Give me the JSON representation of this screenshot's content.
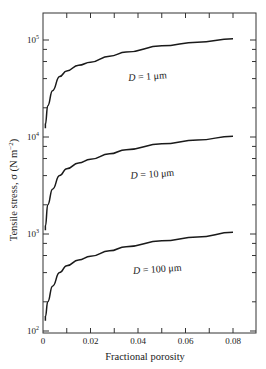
{
  "chart_data": {
    "type": "line",
    "title": "",
    "xlabel": "Fractional porosity",
    "ylabel": "Tensile stress, σ (N m⁻²)",
    "xlim": [
      0,
      0.09
    ],
    "ylim": [
      100,
      200000
    ],
    "yscale": "log",
    "grid": false,
    "legend": "none (inline annotations)",
    "x_ticks": [
      0,
      0.02,
      0.04,
      0.06,
      0.08
    ],
    "x_tick_labels": [
      "0",
      "0.02",
      "0.04",
      "0.06",
      "0.08"
    ],
    "x_minor_ticks": [
      0.01,
      0.03,
      0.05,
      0.07
    ],
    "y_ticks": [
      100,
      1000,
      10000,
      100000
    ],
    "y_tick_labels": [
      [
        "10",
        "2"
      ],
      [
        "10",
        "3"
      ],
      [
        "10",
        "4"
      ],
      [
        "10",
        "5"
      ]
    ],
    "x": [
      0.001,
      0.002,
      0.004,
      0.007,
      0.01,
      0.015,
      0.02,
      0.028,
      0.035,
      0.05,
      0.065,
      0.08
    ],
    "series": [
      {
        "name": "D = 1 μm",
        "label_parts": [
          "D",
          " = 1 μm"
        ],
        "values": [
          13500,
          21000,
          30000,
          42000,
          48000,
          55000,
          59000,
          68000,
          75000,
          87000,
          95000,
          103000
        ],
        "label_pos": [
          0.036,
          48000
        ]
      },
      {
        "name": "D = 10 μm",
        "label_parts": [
          "D",
          " = 10 μm"
        ],
        "values": [
          1200,
          2000,
          2900,
          4000,
          4700,
          5400,
          5900,
          6700,
          7400,
          8500,
          9300,
          10200
        ],
        "label_pos": [
          0.037,
          4700
        ]
      },
      {
        "name": "D = 100 μm",
        "label_parts": [
          "D",
          " = 100 μm"
        ],
        "values": [
          140,
          200,
          290,
          400,
          470,
          540,
          590,
          670,
          740,
          850,
          930,
          1040
        ],
        "label_pos": [
          0.038,
          490
        ]
      }
    ]
  }
}
